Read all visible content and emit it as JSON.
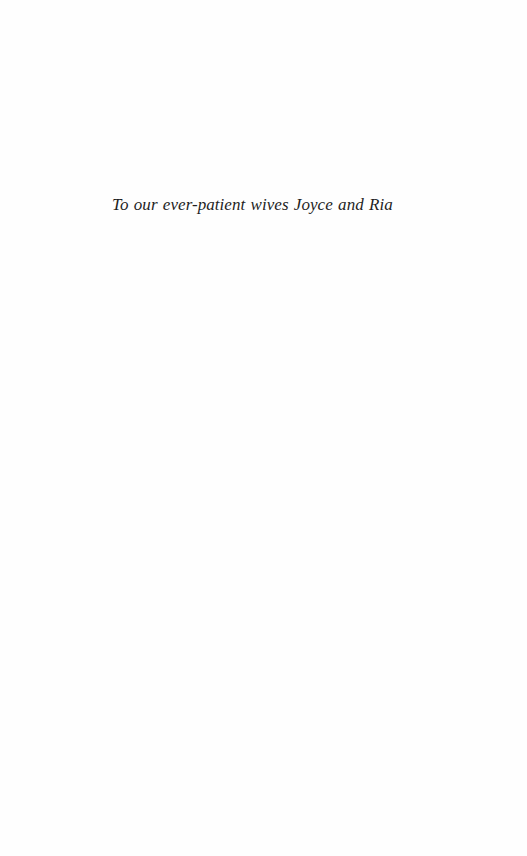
{
  "page": {
    "type": "dedication",
    "background_color": "#fefefe",
    "text_color": "#1e1e1e"
  },
  "dedication": {
    "text": "To our ever-patient wives Joyce and Ria"
  }
}
